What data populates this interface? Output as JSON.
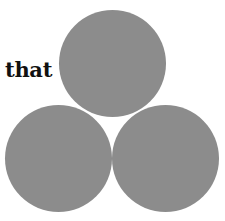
{
  "label": {
    "text": "that"
  },
  "circles": [
    {
      "id": "top",
      "color": "#8c8c8c"
    },
    {
      "id": "bottom-left",
      "color": "#8c8c8c"
    },
    {
      "id": "bottom-right",
      "color": "#8c8c8c"
    }
  ]
}
